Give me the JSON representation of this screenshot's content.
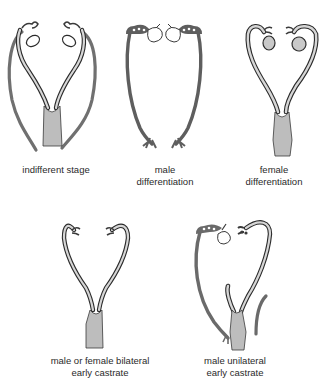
{
  "figure": {
    "panels": [
      {
        "id": "indifferent",
        "caption": [
          "indifferent stage"
        ]
      },
      {
        "id": "male",
        "caption": [
          "male",
          "differentiation"
        ]
      },
      {
        "id": "female",
        "caption": [
          "female",
          "differentiation"
        ]
      },
      {
        "id": "bilateral-castrate",
        "caption": [
          "male or female bilateral",
          "early castrate"
        ]
      },
      {
        "id": "unilateral-castrate",
        "caption": [
          "male unilateral",
          "early castrate"
        ]
      }
    ],
    "colors": {
      "wolffian_duct": "#6e6e6e",
      "mullerian_outline": "#2b2b2b",
      "mullerian_fill": "#d6d6d6",
      "uterus_fill": "#bdbdbd",
      "gonad_fill": "#c9c9c9",
      "text": "#2a2a2a"
    }
  }
}
